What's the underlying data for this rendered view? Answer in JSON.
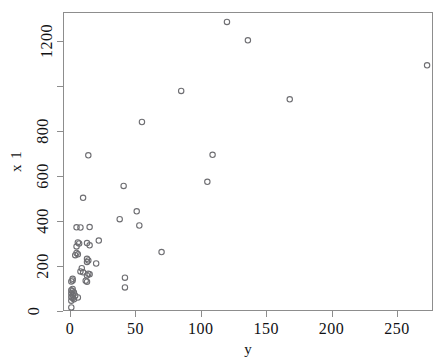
{
  "chart_data": {
    "type": "scatter",
    "title": "",
    "subtitle": "",
    "xlabel": "y",
    "ylabel": "x 1",
    "xlim": [
      -15,
      268
    ],
    "ylim": [
      -30,
      1330
    ],
    "grid": false,
    "legend": null,
    "marker": "open-circle",
    "marker_color": "#6e6e72",
    "xticks": [
      0,
      50,
      100,
      150,
      200,
      250
    ],
    "xticklabels": [
      "0",
      "50",
      "100",
      "150",
      "200",
      "250"
    ],
    "yticks": [
      0,
      200,
      400,
      600,
      800,
      1000,
      1200
    ],
    "yticklabels": [
      "0",
      "200",
      "400",
      "600",
      "800",
      "",
      "1200"
    ],
    "n_points": 57,
    "points": [
      {
        "x": 120,
        "y": 1285
      },
      {
        "x": 136,
        "y": 1203
      },
      {
        "x": 273,
        "y": 1092
      },
      {
        "x": 85,
        "y": 978
      },
      {
        "x": 168,
        "y": 941
      },
      {
        "x": 55,
        "y": 840
      },
      {
        "x": 14,
        "y": 692
      },
      {
        "x": 109,
        "y": 694
      },
      {
        "x": 41,
        "y": 556
      },
      {
        "x": 105,
        "y": 574
      },
      {
        "x": 10,
        "y": 503
      },
      {
        "x": 51,
        "y": 443
      },
      {
        "x": 38,
        "y": 408
      },
      {
        "x": 53,
        "y": 380
      },
      {
        "x": 5,
        "y": 372
      },
      {
        "x": 8,
        "y": 371
      },
      {
        "x": 15,
        "y": 373
      },
      {
        "x": 22,
        "y": 313
      },
      {
        "x": 6,
        "y": 305
      },
      {
        "x": 7,
        "y": 300
      },
      {
        "x": 13,
        "y": 302
      },
      {
        "x": 15,
        "y": 292
      },
      {
        "x": 5,
        "y": 287
      },
      {
        "x": 70,
        "y": 262
      },
      {
        "x": 5,
        "y": 258
      },
      {
        "x": 6,
        "y": 252
      },
      {
        "x": 4,
        "y": 248
      },
      {
        "x": 13,
        "y": 232
      },
      {
        "x": 14,
        "y": 225
      },
      {
        "x": 20,
        "y": 211
      },
      {
        "x": 13,
        "y": 218
      },
      {
        "x": 9,
        "y": 190
      },
      {
        "x": 8,
        "y": 176
      },
      {
        "x": 10,
        "y": 172
      },
      {
        "x": 14,
        "y": 166
      },
      {
        "x": 15,
        "y": 163
      },
      {
        "x": 13,
        "y": 158
      },
      {
        "x": 42,
        "y": 148
      },
      {
        "x": 2,
        "y": 143
      },
      {
        "x": 2,
        "y": 136
      },
      {
        "x": 1,
        "y": 131
      },
      {
        "x": 12,
        "y": 135
      },
      {
        "x": 13,
        "y": 130
      },
      {
        "x": 42,
        "y": 105
      },
      {
        "x": 2,
        "y": 98
      },
      {
        "x": 1,
        "y": 92
      },
      {
        "x": 2,
        "y": 88
      },
      {
        "x": 3,
        "y": 82
      },
      {
        "x": 1,
        "y": 78
      },
      {
        "x": 2,
        "y": 72
      },
      {
        "x": 4,
        "y": 68
      },
      {
        "x": 1,
        "y": 62
      },
      {
        "x": 2,
        "y": 58
      },
      {
        "x": 6,
        "y": 60
      },
      {
        "x": 3,
        "y": 52
      },
      {
        "x": 1,
        "y": 46
      },
      {
        "x": 1,
        "y": 16
      }
    ]
  },
  "axes": {
    "x_title": "y",
    "y_title": "x 1"
  }
}
